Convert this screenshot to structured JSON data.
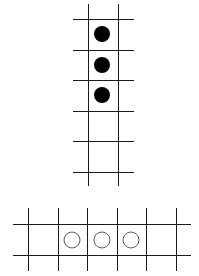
{
  "figure": {
    "width": 199,
    "height": 276,
    "line_color": "#1a1a1a",
    "line_width": 1,
    "top_grid": {
      "orientation": "vertical",
      "vertical_lines_x": [
        88,
        118
      ],
      "vertical_extent": [
        4,
        186
      ],
      "horizontal_lines_y": [
        19,
        50,
        80,
        111,
        141,
        172
      ],
      "horizontal_extent": [
        73,
        134
      ],
      "stones": [
        {
          "cx": 102,
          "cy": 34,
          "r": 8,
          "fill": "#000000",
          "type": "filled"
        },
        {
          "cx": 102,
          "cy": 65,
          "r": 8,
          "fill": "#000000",
          "type": "filled"
        },
        {
          "cx": 102,
          "cy": 95,
          "r": 8,
          "fill": "#000000",
          "type": "filled"
        }
      ]
    },
    "bottom_grid": {
      "orientation": "horizontal",
      "vertical_lines_x": [
        28,
        58,
        87,
        117,
        146,
        176
      ],
      "vertical_extent": [
        208,
        271
      ],
      "horizontal_lines_y": [
        224,
        255
      ],
      "horizontal_extent": [
        13,
        191
      ],
      "stones": [
        {
          "cx": 72,
          "cy": 240,
          "r": 8,
          "fill": "none",
          "type": "hollow"
        },
        {
          "cx": 102,
          "cy": 240,
          "r": 8,
          "fill": "none",
          "type": "hollow"
        },
        {
          "cx": 131,
          "cy": 240,
          "r": 8,
          "fill": "none",
          "type": "hollow"
        }
      ]
    }
  }
}
